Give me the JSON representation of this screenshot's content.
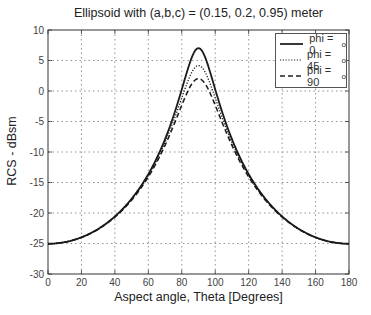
{
  "chart_data": {
    "type": "line",
    "title": "Ellipsoid with (a,b,c) = (0.15, 0.2, 0.95)  meter",
    "xlabel": "Aspect angle, Theta [Degrees]",
    "ylabel": "RCS - dBsm",
    "xlim": [
      0,
      180
    ],
    "ylim": [
      -30,
      10
    ],
    "xticks": [
      0,
      20,
      40,
      60,
      80,
      100,
      120,
      140,
      160,
      180
    ],
    "yticks": [
      10,
      5,
      0,
      -5,
      -10,
      -15,
      -20,
      -25,
      -30
    ],
    "grid": true,
    "legend_position": "upper right",
    "ellipsoid": {
      "a": 0.15,
      "b": 0.2,
      "c": 0.95
    },
    "x": [
      0,
      10,
      20,
      30,
      40,
      50,
      60,
      70,
      80,
      90,
      100,
      110,
      120,
      130,
      140,
      150,
      160,
      170,
      180
    ],
    "series": [
      {
        "name": "phi = 0",
        "phi_deg": 0,
        "style": "solid",
        "values": [
          -25.0,
          -24.8,
          -24.0,
          -22.6,
          -20.6,
          -17.7,
          -13.6,
          -7.9,
          0.3,
          7.0,
          0.3,
          -7.9,
          -13.6,
          -17.7,
          -20.6,
          -22.6,
          -24.0,
          -24.8,
          -25.0
        ]
      },
      {
        "name": "phi = 45",
        "phi_deg": 45,
        "style": "dotted",
        "values": [
          -25.0,
          -24.8,
          -24.0,
          -22.6,
          -20.5,
          -17.6,
          -13.5,
          -8.0,
          -0.9,
          4.2,
          -0.9,
          -8.0,
          -13.5,
          -17.6,
          -20.5,
          -22.6,
          -24.0,
          -24.8,
          -25.0
        ]
      },
      {
        "name": "phi = 90",
        "phi_deg": 90,
        "style": "dashed",
        "values": [
          -25.0,
          -24.8,
          -24.0,
          -22.6,
          -20.5,
          -17.5,
          -13.4,
          -8.1,
          -1.8,
          2.0,
          -1.8,
          -8.1,
          -13.4,
          -17.5,
          -20.5,
          -22.6,
          -24.0,
          -24.8,
          -25.0
        ]
      }
    ]
  },
  "legend": {
    "items": [
      {
        "label": "phi = 0",
        "sup": "o",
        "style": "solid"
      },
      {
        "label": "phi = 45",
        "sup": "o",
        "style": "dotted"
      },
      {
        "label": "phi = 90",
        "sup": "o",
        "style": "dashed"
      }
    ]
  }
}
